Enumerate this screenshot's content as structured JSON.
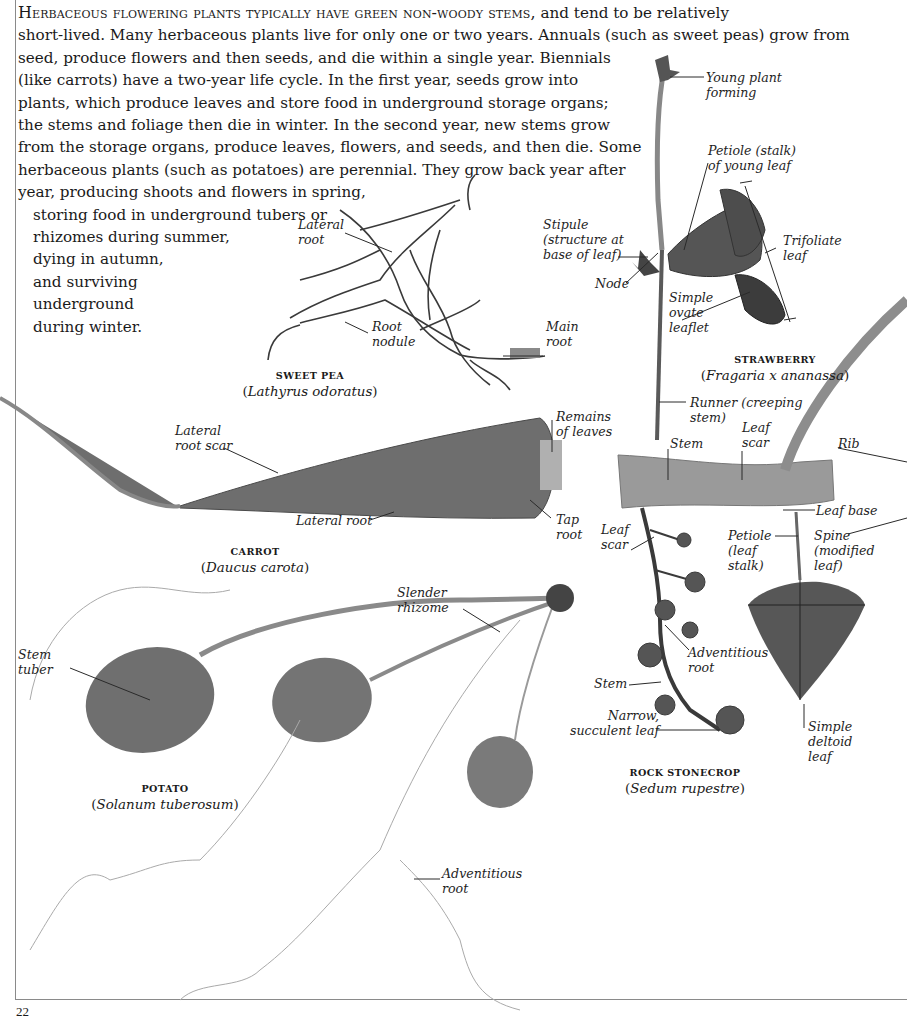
{
  "page": {
    "number": "22"
  },
  "intro": {
    "lead": "Herbaceous flowering plants typically have green non-woody stems,",
    "lines": [
      " and tend to be relatively",
      "short-lived. Many herbaceous plants live for only one or two years. Annuals (such as sweet peas) grow from",
      "seed, produce flowers and then seeds, and die within a single year. Biennials",
      "(like carrots) have a two-year life cycle. In the first year, seeds grow into",
      "plants, which produce leaves and store food in underground storage organs;",
      "the stems and foliage then die in winter. In the second year, new stems grow",
      "from the storage organs, produce leaves, flowers, and seeds, and then die. Some",
      "herbaceous plants (such as potatoes) are perennial. They grow back year after",
      "year, producing shoots and flowers in spring,",
      "storing food in underground tubers or",
      "rhizomes during summer,",
      "dying in autumn,",
      "and surviving",
      "underground",
      "during winter."
    ]
  },
  "specimens": {
    "sweet_pea": {
      "common": "SWEET PEA",
      "latin": "Lathyrus odoratus",
      "labels": {
        "lateral_root": [
          "Lateral",
          "root"
        ],
        "root_nodule": [
          "Root",
          "nodule"
        ],
        "main_root": [
          "Main",
          "root"
        ]
      }
    },
    "strawberry": {
      "common": "STRAWBERRY",
      "latin": "Fragaria x ananassa",
      "labels": {
        "young_plant": [
          "Young plant",
          "forming"
        ],
        "petiole": [
          "Petiole (stalk)",
          "of young leaf"
        ],
        "stipule": [
          "Stipule",
          "(structure at",
          "base of leaf)"
        ],
        "trifoliate": [
          "Trifoliate",
          "leaf"
        ],
        "node": [
          "Node"
        ],
        "simple_ovate": [
          "Simple",
          "ovate",
          "leaflet"
        ],
        "runner": [
          "Runner (creeping",
          "stem)"
        ]
      }
    },
    "carrot": {
      "common": "CARROT",
      "latin": "Daucus carota",
      "labels": {
        "lateral_root_scar": [
          "Lateral",
          "root scar"
        ],
        "remains_of_leaves": [
          "Remains",
          "of leaves"
        ],
        "lateral_root": [
          "Lateral root"
        ],
        "tap_root": [
          "Tap",
          "root"
        ]
      }
    },
    "stem_cutting": {
      "labels": {
        "stem": [
          "Stem"
        ],
        "leaf_scar": [
          "Leaf",
          "scar"
        ],
        "rib": [
          "Rib"
        ]
      }
    },
    "leaf_diagram": {
      "labels": {
        "leaf_base": [
          "Leaf base"
        ],
        "petiole": [
          "Petiole",
          "(leaf",
          "stalk)"
        ],
        "spine": [
          "Spine",
          "(modified",
          "leaf)"
        ],
        "simple_deltoid": [
          "Simple",
          "deltoid",
          "leaf"
        ]
      }
    },
    "potato": {
      "common": "POTATO",
      "latin": "Solanum tuberosum",
      "labels": {
        "stem_tuber": [
          "Stem",
          "tuber"
        ],
        "slender_rhizome": [
          "Slender",
          "rhizome"
        ],
        "adventitious_root": [
          "Adventitious",
          "root"
        ]
      }
    },
    "rock_stonecrop": {
      "common": "ROCK STONECROP",
      "latin": "Sedum rupestre",
      "labels": {
        "leaf_scar": [
          "Leaf",
          "scar"
        ],
        "adventitious_root": [
          "Adventitious",
          "root"
        ],
        "stem": [
          "Stem"
        ],
        "narrow_leaf": [
          "Narrow,",
          "succulent leaf"
        ]
      }
    }
  },
  "colors": {
    "text": "#1a1a1a",
    "rule": "#8a8a8a",
    "specimen_dark": "#3a3a3a",
    "specimen_mid": "#6e6e6e",
    "specimen_light": "#9a9a9a"
  }
}
